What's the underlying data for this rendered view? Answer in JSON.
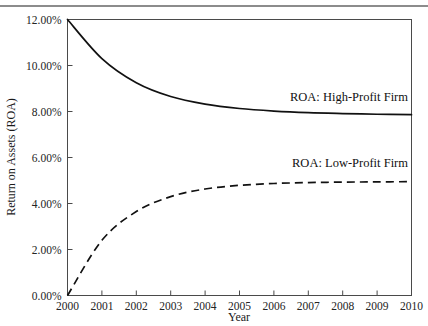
{
  "figure": {
    "background_color": "#ffffff",
    "rule_color": "#8c8c8c",
    "axis_color": "#4a4a4a",
    "series_color": "#111111"
  },
  "chart_data": {
    "type": "line",
    "title": "",
    "xlabel": "Year",
    "ylabel": "Return on Assets (ROA)",
    "x": [
      2000,
      2001,
      2002,
      2003,
      2004,
      2005,
      2006,
      2007,
      2008,
      2009,
      2010
    ],
    "xlim": [
      2000,
      2010
    ],
    "ylim": [
      0,
      12
    ],
    "yticks": [
      0,
      2,
      4,
      6,
      8,
      10,
      12
    ],
    "ytick_labels": [
      "0.00%",
      "2.00%",
      "4.00%",
      "6.00%",
      "8.00%",
      "10.00%",
      "12.00%"
    ],
    "xtick_labels": [
      "2000",
      "2001",
      "2002",
      "2003",
      "2004",
      "2005",
      "2006",
      "2007",
      "2008",
      "2009",
      "2010"
    ],
    "grid": false,
    "legend_position": "inline-annotation",
    "series": [
      {
        "name": "ROA: High-Profit Firm",
        "style": "solid",
        "values": [
          12.0,
          10.3,
          9.25,
          8.65,
          8.32,
          8.13,
          8.02,
          7.95,
          7.91,
          7.88,
          7.86
        ],
        "annotation": "ROA: High-Profit Firm"
      },
      {
        "name": "ROA: Low-Profit Firm",
        "style": "dashed",
        "values": [
          0.0,
          2.4,
          3.65,
          4.3,
          4.63,
          4.79,
          4.87,
          4.91,
          4.93,
          4.94,
          4.95
        ],
        "annotation": "ROA: Low-Profit Firm"
      }
    ]
  }
}
